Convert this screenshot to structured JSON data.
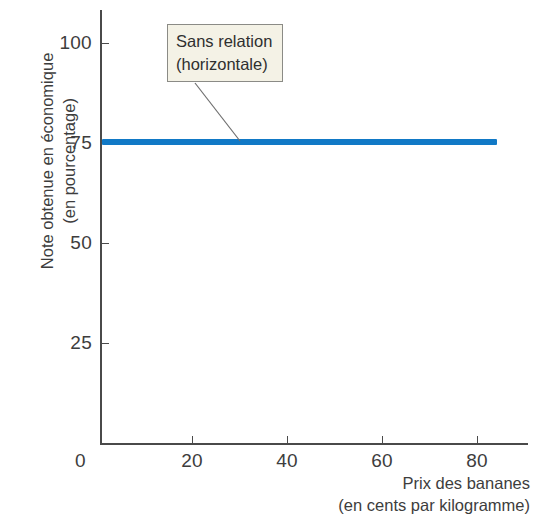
{
  "chart_data": {
    "type": "line",
    "title": "",
    "xlabel": "Prix des bananes (en cents par kilogramme)",
    "ylabel": "Note obtenue en économique (en pourcentage)",
    "xlabel_lines": [
      "Prix des bananes",
      "(en cents par kilogramme)"
    ],
    "ylabel_lines": [
      "Note obtenue en économique",
      "(en pourcentage)"
    ],
    "xlim": [
      0,
      90
    ],
    "ylim": [
      0,
      108
    ],
    "grid": false,
    "legend": null,
    "x_ticks": [
      {
        "value": 0,
        "label": "0"
      },
      {
        "value": 20,
        "label": "20"
      },
      {
        "value": 40,
        "label": "40"
      },
      {
        "value": 60,
        "label": "60"
      },
      {
        "value": 80,
        "label": "80"
      }
    ],
    "y_ticks": [
      {
        "value": 25,
        "label": "25"
      },
      {
        "value": 50,
        "label": "50"
      },
      {
        "value": 75,
        "label": "75"
      },
      {
        "value": 100,
        "label": "100"
      }
    ],
    "series": [
      {
        "name": "Sans relation",
        "color": "#1179c6",
        "line_width_px": 6,
        "x": [
          0.4,
          83.5
        ],
        "values": [
          75,
          75
        ],
        "constant_y": 75
      }
    ],
    "annotations": [
      {
        "id": "no-relation-callout",
        "lines": [
          "Sans relation",
          "(horizontale)"
        ],
        "box_fill": "#f4f2e6",
        "box_border": "#8b8b86",
        "pointer_from": {
          "x": 195,
          "y": 83
        },
        "pointer_to": {
          "x": 240,
          "y": 141
        }
      }
    ]
  },
  "axis": {
    "origin_label": "0",
    "axis_color": "#4a4a4a"
  }
}
